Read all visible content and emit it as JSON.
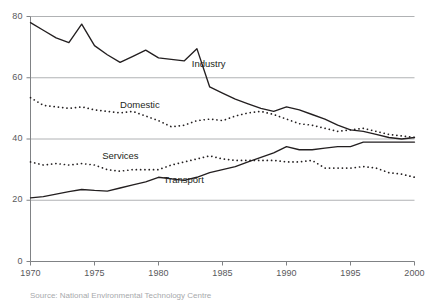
{
  "chart_data": {
    "type": "line",
    "title": "",
    "subtitle": "",
    "xlabel": "",
    "ylabel": "",
    "xlim": [
      1970,
      2000
    ],
    "ylim": [
      0,
      80
    ],
    "grid": true,
    "gridlines_y": [
      0,
      20,
      40,
      60,
      80
    ],
    "legend_position": "inline-annotations",
    "y_ticks": [
      "0",
      "20",
      "40",
      "60",
      "80"
    ],
    "y_tick_values": [
      0,
      20,
      40,
      60,
      80
    ],
    "x_ticks": [
      "1970",
      "1975",
      "1980",
      "1985",
      "1990",
      "1995",
      "2000"
    ],
    "x_tick_values": [
      1970,
      1975,
      1980,
      1985,
      1990,
      1995,
      2000
    ],
    "x": [
      1970,
      1971,
      1972,
      1973,
      1974,
      1975,
      1976,
      1977,
      1978,
      1979,
      1980,
      1981,
      1982,
      1983,
      1984,
      1985,
      1986,
      1987,
      1988,
      1989,
      1990,
      1991,
      1992,
      1993,
      1994,
      1995,
      1996,
      1997,
      1998,
      1999,
      2000
    ],
    "series": [
      {
        "name": "Industry",
        "style": "solid",
        "color": "#231f20",
        "label_x": 1982.6,
        "label_y": 64.5,
        "values": [
          78.0,
          75.5,
          73.0,
          71.5,
          77.5,
          70.5,
          67.5,
          65.0,
          67.0,
          69.0,
          66.5,
          66.0,
          65.5,
          69.5,
          57.0,
          55.0,
          53.0,
          51.5,
          50.0,
          49.0,
          50.5,
          49.5,
          48.0,
          46.5,
          44.5,
          43.0,
          42.5,
          41.5,
          40.5,
          40.0,
          40.5
        ]
      },
      {
        "name": "Domestic",
        "style": "dotted",
        "color": "#231f20",
        "label_x": 1977.0,
        "label_y": 51.0,
        "values": [
          53.5,
          51.0,
          50.5,
          50.0,
          50.5,
          49.5,
          49.0,
          48.5,
          49.0,
          47.5,
          46.0,
          44.0,
          44.5,
          46.0,
          46.5,
          46.0,
          47.5,
          48.5,
          49.0,
          48.0,
          46.5,
          45.0,
          44.5,
          43.5,
          42.5,
          43.0,
          43.5,
          42.5,
          41.5,
          41.0,
          40.5
        ]
      },
      {
        "name": "Services",
        "style": "dotted",
        "color": "#231f20",
        "label_x": 1975.6,
        "label_y": 34.5,
        "values": [
          32.5,
          31.5,
          32.0,
          31.5,
          32.0,
          31.5,
          30.0,
          29.5,
          30.0,
          30.0,
          30.0,
          31.5,
          32.5,
          33.5,
          34.5,
          33.5,
          33.0,
          33.0,
          33.0,
          33.0,
          32.5,
          32.5,
          33.0,
          30.5,
          30.5,
          30.5,
          31.0,
          30.5,
          29.0,
          28.5,
          27.5
        ]
      },
      {
        "name": "Transport",
        "style": "solid",
        "color": "#231f20",
        "label_x": 1980.4,
        "label_y": 26.5,
        "values": [
          20.8,
          21.2,
          22.0,
          22.8,
          23.5,
          23.2,
          23.0,
          24.0,
          25.0,
          26.0,
          27.5,
          27.0,
          26.5,
          27.5,
          29.0,
          30.0,
          31.0,
          32.5,
          34.0,
          35.5,
          37.5,
          36.5,
          36.5,
          37.0,
          37.5,
          37.5,
          39.0,
          39.0,
          39.0,
          39.0,
          39.0
        ]
      }
    ]
  },
  "caption": {
    "text": "Source: National Environmental Technology Centre"
  }
}
